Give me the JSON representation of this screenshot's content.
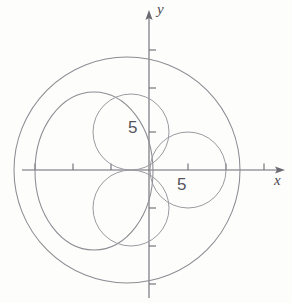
{
  "figure": {
    "kind": "polar-rose-diagram",
    "width": 292,
    "height": 303,
    "background": "#fdfdfc",
    "curve_color": "#8c8c93",
    "axis_color": "#6a6a72",
    "text_color": "#55555c"
  },
  "axes": {
    "x": {
      "name": "x",
      "origin_px": 149,
      "px_per_unit": 7.6,
      "arrow_tip_px": 285,
      "left_end_px": 22,
      "tick_values": [
        -15,
        -10,
        -5,
        5,
        10,
        15
      ],
      "tick_px": [
        35,
        73,
        111,
        188,
        226,
        264
      ],
      "tick_label_shown": "5",
      "tick_label_value": 5
    },
    "y": {
      "name": "y",
      "origin_px": 170,
      "px_per_unit": 7.6,
      "arrow_tip_px": 10,
      "bottom_end_px": 298,
      "tick_values": [
        15,
        10,
        -5,
        -10,
        -15
      ],
      "tick_px": [
        50,
        88,
        208,
        246,
        284
      ],
      "tick_label_shown": "5",
      "tick_label_value": 5
    }
  },
  "labels": {
    "x_axis": "x",
    "y_axis": "y",
    "y_tick_five": "5",
    "x_tick_five": "5"
  },
  "chart_data": {
    "type": "scatter",
    "title": "",
    "xlabel": "x",
    "ylabel": "y",
    "grid": false,
    "legend": "none",
    "xlim": [
      -16.7,
      17.9
    ],
    "ylim": [
      -16.8,
      17.3
    ],
    "annotations": [
      "5",
      "5"
    ],
    "circles": [
      {
        "name": "large-right-circle",
        "center": [
          -2.9,
          0
        ],
        "radius": 14.9,
        "center_px": [
          127,
          170
        ],
        "radius_px": [
          113,
          113
        ]
      },
      {
        "name": "large-left-circle",
        "center": [
          -7.2,
          0
        ],
        "radius": 8.0,
        "center_px": [
          94,
          171
        ],
        "radius_px": [
          59,
          79
        ]
      },
      {
        "name": "upper-lobe-circle",
        "center": [
          -2.4,
          5.0
        ],
        "radius": 5.0,
        "center_px": [
          131,
          132
        ],
        "radius_px": [
          38,
          38
        ]
      },
      {
        "name": "lower-lobe-circle",
        "center": [
          -2.4,
          -5.0
        ],
        "radius": 5.0,
        "center_px": [
          131,
          208
        ],
        "radius_px": [
          38,
          38
        ]
      },
      {
        "name": "right-lobe-circle",
        "center": [
          5.1,
          0
        ],
        "radius": 5.0,
        "center_px": [
          188,
          170
        ],
        "radius_px": [
          38,
          38
        ]
      }
    ]
  }
}
